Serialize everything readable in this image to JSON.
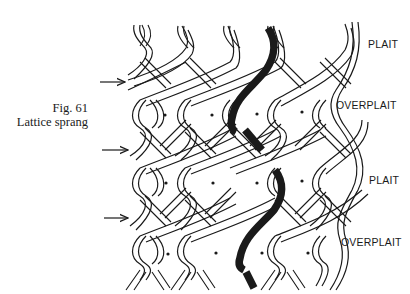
{
  "figure": {
    "number": "Fig. 61",
    "title": "Lattice sprang"
  },
  "row_labels": [
    {
      "text": "PLAIT",
      "x": 368,
      "y": 45
    },
    {
      "text": "OVERPLAIT",
      "x": 336,
      "y": 106
    },
    {
      "text": "PLAIT",
      "x": 369,
      "y": 181
    },
    {
      "text": "OVERPLAIT",
      "x": 341,
      "y": 243
    }
  ],
  "arrows": [
    {
      "x1": 100,
      "x2": 125,
      "y": 82
    },
    {
      "x1": 102,
      "x2": 128,
      "y": 150
    },
    {
      "x1": 104,
      "x2": 128,
      "y": 218
    }
  ],
  "colors": {
    "ink": "#1a1a1a",
    "background": "#ffffff"
  }
}
